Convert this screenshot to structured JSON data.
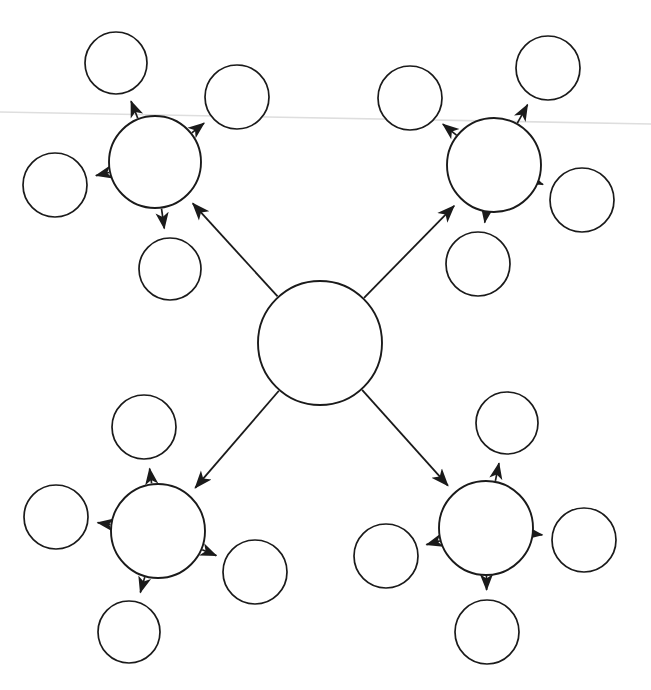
{
  "canvas": {
    "width": 651,
    "height": 690,
    "background": "#ffffff",
    "stroke_color": "#1a1a1a",
    "fold_line_color": "#dedede"
  },
  "diagram": {
    "type": "hub-and-spoke-network",
    "title": "",
    "center_node": {
      "id": "center",
      "label": "",
      "cx": 320,
      "cy": 343,
      "r": 62
    },
    "hubs": [
      {
        "id": "hub-top-left",
        "label": "",
        "cx": 155,
        "cy": 162,
        "r": 46
      },
      {
        "id": "hub-top-right",
        "label": "",
        "cx": 494,
        "cy": 165,
        "r": 47
      },
      {
        "id": "hub-bottom-left",
        "label": "",
        "cx": 158,
        "cy": 531,
        "r": 47
      },
      {
        "id": "hub-bottom-right",
        "label": "",
        "cx": 486,
        "cy": 528,
        "r": 47
      }
    ],
    "leaves": [
      {
        "id": "leaf-tl-up",
        "parent": "hub-top-left",
        "label": "",
        "cx": 116,
        "cy": 63,
        "r": 31
      },
      {
        "id": "leaf-tl-right",
        "parent": "hub-top-left",
        "label": "",
        "cx": 237,
        "cy": 97,
        "r": 32
      },
      {
        "id": "leaf-tl-left",
        "parent": "hub-top-left",
        "label": "",
        "cx": 55,
        "cy": 185,
        "r": 32
      },
      {
        "id": "leaf-tl-down",
        "parent": "hub-top-left",
        "label": "",
        "cx": 170,
        "cy": 269,
        "r": 31
      },
      {
        "id": "leaf-tr-left",
        "parent": "hub-top-right",
        "label": "",
        "cx": 410,
        "cy": 98,
        "r": 32
      },
      {
        "id": "leaf-tr-up",
        "parent": "hub-top-right",
        "label": "",
        "cx": 548,
        "cy": 68,
        "r": 32
      },
      {
        "id": "leaf-tr-right",
        "parent": "hub-top-right",
        "label": "",
        "cx": 582,
        "cy": 200,
        "r": 32
      },
      {
        "id": "leaf-tr-down",
        "parent": "hub-top-right",
        "label": "",
        "cx": 478,
        "cy": 264,
        "r": 32
      },
      {
        "id": "leaf-bl-up",
        "parent": "hub-bottom-left",
        "label": "",
        "cx": 144,
        "cy": 427,
        "r": 32
      },
      {
        "id": "leaf-bl-left",
        "parent": "hub-bottom-left",
        "label": "",
        "cx": 56,
        "cy": 517,
        "r": 32
      },
      {
        "id": "leaf-bl-right",
        "parent": "hub-bottom-left",
        "label": "",
        "cx": 255,
        "cy": 572,
        "r": 32
      },
      {
        "id": "leaf-bl-down",
        "parent": "hub-bottom-left",
        "label": "",
        "cx": 129,
        "cy": 632,
        "r": 31
      },
      {
        "id": "leaf-br-up",
        "parent": "hub-bottom-right",
        "label": "",
        "cx": 507,
        "cy": 423,
        "r": 31
      },
      {
        "id": "leaf-br-left",
        "parent": "hub-bottom-right",
        "label": "",
        "cx": 386,
        "cy": 556,
        "r": 32
      },
      {
        "id": "leaf-br-right",
        "parent": "hub-bottom-right",
        "label": "",
        "cx": 584,
        "cy": 540,
        "r": 32
      },
      {
        "id": "leaf-br-down",
        "parent": "hub-bottom-right",
        "label": "",
        "cx": 487,
        "cy": 632,
        "r": 32
      }
    ],
    "edges": [
      {
        "id": "edge-center-tl",
        "from": "center",
        "to": "hub-top-left",
        "arrow": "to",
        "label": ""
      },
      {
        "id": "edge-center-tr",
        "from": "center",
        "to": "hub-top-right",
        "arrow": "to",
        "label": ""
      },
      {
        "id": "edge-center-bl",
        "from": "center",
        "to": "hub-bottom-left",
        "arrow": "to",
        "label": ""
      },
      {
        "id": "edge-center-br",
        "from": "center",
        "to": "hub-bottom-right",
        "arrow": "to",
        "label": ""
      },
      {
        "id": "edge-tl-up",
        "from": "hub-top-left",
        "to": "leaf-tl-up",
        "arrow": "to",
        "label": ""
      },
      {
        "id": "edge-tl-right",
        "from": "hub-top-left",
        "to": "leaf-tl-right",
        "arrow": "to",
        "label": ""
      },
      {
        "id": "edge-tl-left",
        "from": "hub-top-left",
        "to": "leaf-tl-left",
        "arrow": "to",
        "label": ""
      },
      {
        "id": "edge-tl-down",
        "from": "hub-top-left",
        "to": "leaf-tl-down",
        "arrow": "to",
        "label": ""
      },
      {
        "id": "edge-tr-left",
        "from": "hub-top-right",
        "to": "leaf-tr-left",
        "arrow": "to",
        "label": ""
      },
      {
        "id": "edge-tr-up",
        "from": "hub-top-right",
        "to": "leaf-tr-up",
        "arrow": "to",
        "label": ""
      },
      {
        "id": "edge-tr-right",
        "from": "hub-top-right",
        "to": "leaf-tr-right",
        "arrow": "to",
        "label": ""
      },
      {
        "id": "edge-tr-down",
        "from": "hub-top-right",
        "to": "leaf-tr-down",
        "arrow": "to",
        "label": ""
      },
      {
        "id": "edge-bl-up",
        "from": "hub-bottom-left",
        "to": "leaf-bl-up",
        "arrow": "to",
        "label": ""
      },
      {
        "id": "edge-bl-left",
        "from": "hub-bottom-left",
        "to": "leaf-bl-left",
        "arrow": "to",
        "label": ""
      },
      {
        "id": "edge-bl-right",
        "from": "hub-bottom-left",
        "to": "leaf-bl-right",
        "arrow": "to",
        "label": ""
      },
      {
        "id": "edge-bl-down",
        "from": "hub-bottom-left",
        "to": "leaf-bl-down",
        "arrow": "to",
        "label": ""
      },
      {
        "id": "edge-br-up",
        "from": "hub-bottom-right",
        "to": "leaf-br-up",
        "arrow": "to",
        "label": ""
      },
      {
        "id": "edge-br-left",
        "from": "hub-bottom-right",
        "to": "leaf-br-left",
        "arrow": "to",
        "label": ""
      },
      {
        "id": "edge-br-right",
        "from": "hub-bottom-right",
        "to": "leaf-br-right",
        "arrow": "to",
        "label": ""
      },
      {
        "id": "edge-br-down",
        "from": "hub-bottom-right",
        "to": "leaf-br-down",
        "arrow": "to",
        "label": ""
      }
    ],
    "artifacts": [
      {
        "id": "scan-fold-line",
        "type": "line",
        "x1": 0,
        "y1": 112,
        "x2": 651,
        "y2": 124
      }
    ]
  }
}
